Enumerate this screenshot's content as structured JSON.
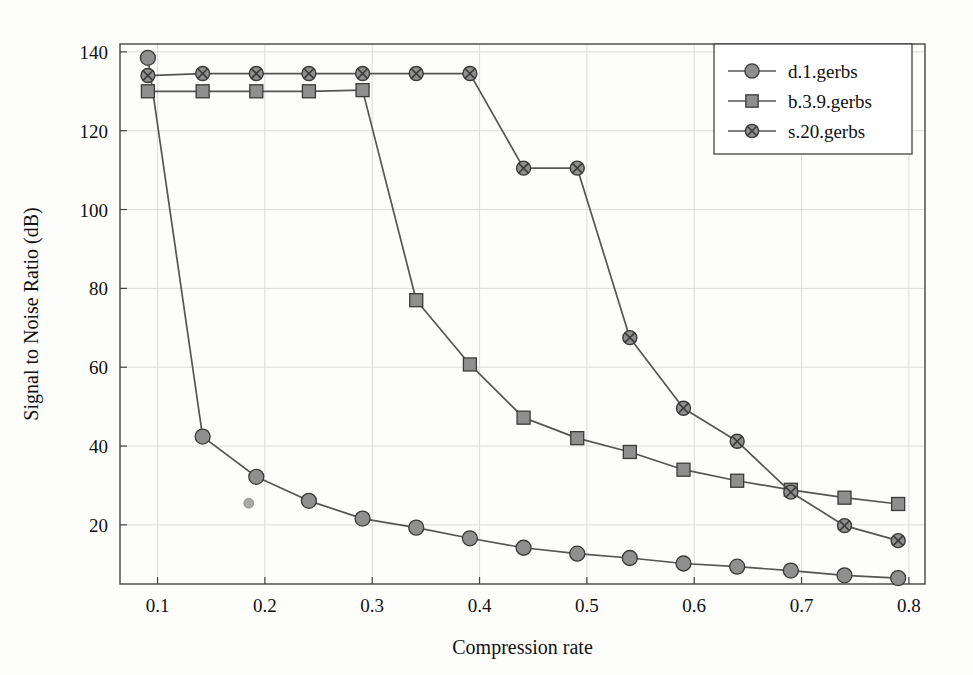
{
  "chart_data": {
    "type": "line",
    "title": "",
    "xlabel": "Compression rate",
    "ylabel": "Signal to Noise Ratio (dB)",
    "xlim": [
      0.065,
      0.815
    ],
    "ylim": [
      5,
      142
    ],
    "xticks": [
      0.1,
      0.2,
      0.3,
      0.4,
      0.5,
      0.6,
      0.7,
      0.8
    ],
    "xticklabels": [
      "0.1",
      "0.2",
      "0.3",
      "0.4",
      "0.5",
      "0.6",
      "0.7",
      "0.8"
    ],
    "yticks": [
      20,
      40,
      60,
      80,
      100,
      120,
      140
    ],
    "yticklabels": [
      "20",
      "40",
      "60",
      "80",
      "100",
      "120",
      "140"
    ],
    "grid": true,
    "legend_position": "top-right",
    "series": [
      {
        "name": "d.1.gerbs",
        "marker": "circle",
        "x": [
          0.091,
          0.142,
          0.192,
          0.241,
          0.291,
          0.341,
          0.391,
          0.441,
          0.491,
          0.54,
          0.59,
          0.64,
          0.69,
          0.74,
          0.79
        ],
        "y": [
          138.5,
          42.4,
          32.2,
          26.1,
          21.6,
          19.3,
          16.6,
          14.2,
          12.7,
          11.6,
          10.2,
          9.4,
          8.4,
          7.2,
          6.5
        ]
      },
      {
        "name": "b.3.9.gerbs",
        "marker": "square",
        "x": [
          0.091,
          0.142,
          0.192,
          0.241,
          0.291,
          0.341,
          0.391,
          0.441,
          0.491,
          0.54,
          0.59,
          0.64,
          0.69,
          0.74,
          0.79
        ],
        "y": [
          130.0,
          130.0,
          130.0,
          130.0,
          130.3,
          77.0,
          60.7,
          47.2,
          42.0,
          38.5,
          34.0,
          31.2,
          28.9,
          26.9,
          25.3
        ]
      },
      {
        "name": "s.20.gerbs",
        "marker": "circle-cross",
        "x": [
          0.091,
          0.142,
          0.192,
          0.241,
          0.291,
          0.341,
          0.391,
          0.441,
          0.491,
          0.54,
          0.59,
          0.64,
          0.69,
          0.74,
          0.79
        ],
        "y": [
          134.0,
          134.5,
          134.5,
          134.5,
          134.5,
          134.5,
          134.5,
          110.5,
          110.5,
          67.5,
          49.6,
          41.2,
          28.3,
          19.8,
          16.0
        ]
      }
    ],
    "artifacts": [
      {
        "name": "stray-dot",
        "x": 0.185,
        "y": 25.5
      }
    ],
    "colors": {
      "line": "#555555",
      "marker_fill": "#8f8f8f",
      "marker_stroke": "#3a3a3a",
      "grid": "#dcdcdc",
      "axis": "#444444",
      "background": "#fdfdfb"
    }
  },
  "legend": {
    "entries": [
      {
        "label": "d.1.gerbs"
      },
      {
        "label": "b.3.9.gerbs"
      },
      {
        "label": "s.20.gerbs"
      }
    ]
  }
}
